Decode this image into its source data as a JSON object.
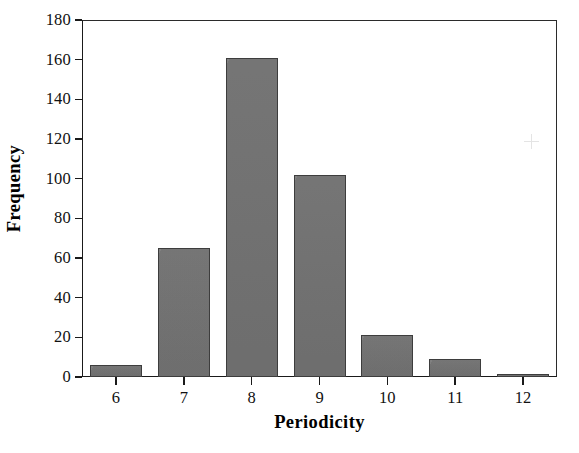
{
  "chart_data": {
    "type": "bar",
    "title": "",
    "subtitle": "",
    "categories": [
      "6",
      "7",
      "8",
      "9",
      "10",
      "11",
      "12"
    ],
    "values": [
      6,
      65,
      161,
      102,
      21,
      9,
      1
    ],
    "xlabel": "Periodicity",
    "ylabel": "Frequency",
    "ylim": [
      0,
      180
    ],
    "ytick_labels": [
      "180",
      "160",
      "140",
      "120",
      "100",
      "80",
      "60",
      "40",
      "20",
      "0"
    ],
    "ytick_values": [
      180,
      160,
      140,
      120,
      100,
      80,
      60,
      40,
      20,
      0
    ],
    "ytick_step": 20,
    "grid": false,
    "legend": null,
    "legend_position": "none",
    "annotations": [],
    "bar_fill_color": "#767676",
    "bar_edge_color": "#3d3d3d",
    "axis_color": "#1a1a1a",
    "background_color": "#ffffff"
  }
}
